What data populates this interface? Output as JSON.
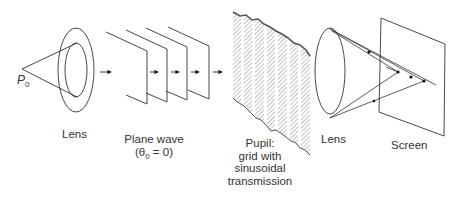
{
  "figure": {
    "point_label": "P",
    "point_subscript": "0",
    "labels": {
      "lens1": "Lens",
      "plane_wave_line1": "Plane wave",
      "plane_wave_theta": "(θ",
      "plane_wave_theta_sub": "0",
      "plane_wave_theta_rest": " = 0)",
      "pupil_line1": "Pupil:",
      "pupil_line2": "grid with",
      "pupil_line3": "sinusoidal",
      "pupil_line4": "transmission",
      "lens2": "Lens",
      "screen": "Screen"
    },
    "components": [
      "point-source",
      "lens",
      "plane-wave",
      "pupil-grid",
      "lens",
      "screen"
    ],
    "colors": {
      "stroke": "#333333",
      "grid_fill": "#9a9a9a",
      "background": "#ffffff"
    }
  }
}
